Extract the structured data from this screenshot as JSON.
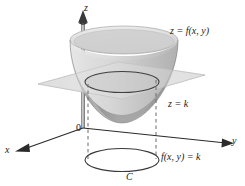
{
  "figure": {
    "background_color": "#ffffff",
    "width": 245,
    "height": 186
  },
  "axes": {
    "z_label": "z",
    "y_label": "y",
    "x_label": "x",
    "origin_label": "0",
    "axis_color": "#2b2b2b"
  },
  "labels": {
    "surface": "z = f(x, y)",
    "plane": "z = k",
    "level_set": "f(x, y) = k",
    "curve": "C"
  },
  "colors": {
    "surface_light": "#d8d8d8",
    "surface_mid": "#b9b9b9",
    "surface_dark": "#9a9a9a",
    "surface_rim": "#e4e4e4",
    "plane_fill": "#dcdcdc",
    "plane_stroke": "#bdbdbd",
    "trace_stroke": "#3a3a3a",
    "dashed_stroke": "#6e6e6e",
    "curve_stroke": "#3a3a3a",
    "axis": "#2b2b2b"
  },
  "geometry": {
    "surface_type": "elliptic paraboloid",
    "rim_center": [
      124,
      40
    ],
    "rim_rx": 54,
    "rim_ry": 14,
    "bottom_vertex": [
      118,
      123
    ],
    "trace_center": [
      122,
      82
    ],
    "trace_rx": 37,
    "trace_ry": 10,
    "level_curve_center": [
      122,
      160
    ],
    "level_curve_rx": 37,
    "level_curve_ry": 11,
    "plane_corners": [
      [
        38,
        84
      ],
      [
        118,
        62
      ],
      [
        205,
        75
      ],
      [
        122,
        99
      ]
    ],
    "dashed_left_x": 88,
    "dashed_right_x": 156,
    "z_axis_top": [
      83,
      14
    ],
    "z_axis_bottom": [
      83,
      128
    ],
    "y_axis_end": [
      233,
      143
    ],
    "x_axis_end": [
      14,
      151
    ],
    "origin": [
      83,
      128
    ]
  }
}
